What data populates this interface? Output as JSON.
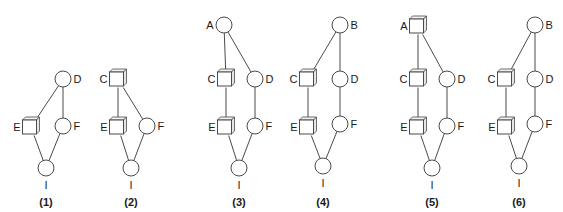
{
  "figure": {
    "colors": {
      "stroke": "#4a4a4a",
      "text": "#1a1a1a",
      "background": "#ffffff"
    },
    "diagrams": [
      {
        "caption": "(1)",
        "bottom_label": "I",
        "nodes": [
          {
            "id": "D",
            "shape": "circle",
            "x": 63,
            "y": 79,
            "label_side": "right"
          },
          {
            "id": "E",
            "shape": "cube",
            "x": 31,
            "y": 127,
            "label_side": "left"
          },
          {
            "id": "F",
            "shape": "circle",
            "x": 63,
            "y": 126,
            "label_side": "right"
          },
          {
            "id": "I",
            "shape": "circle",
            "x": 46,
            "y": 168,
            "label_side": "below"
          }
        ],
        "edges": [
          [
            "D",
            "E"
          ],
          [
            "D",
            "F"
          ],
          [
            "E",
            "I"
          ],
          [
            "F",
            "I"
          ]
        ],
        "caption_x": 46
      },
      {
        "caption": "(2)",
        "bottom_label": "I",
        "nodes": [
          {
            "id": "C",
            "shape": "cube",
            "x": 118,
            "y": 79,
            "label_side": "left"
          },
          {
            "id": "E",
            "shape": "cube",
            "x": 118,
            "y": 127,
            "label_side": "left"
          },
          {
            "id": "F",
            "shape": "circle",
            "x": 147,
            "y": 126,
            "label_side": "right"
          },
          {
            "id": "I",
            "shape": "circle",
            "x": 131,
            "y": 168,
            "label_side": "below"
          }
        ],
        "edges": [
          [
            "C",
            "E"
          ],
          [
            "C",
            "F"
          ],
          [
            "E",
            "I"
          ],
          [
            "F",
            "I"
          ]
        ],
        "caption_x": 131
      },
      {
        "caption": "(3)",
        "bottom_label": "I",
        "nodes": [
          {
            "id": "A",
            "shape": "circle",
            "x": 224,
            "y": 25,
            "label_side": "left"
          },
          {
            "id": "C",
            "shape": "cube",
            "x": 226,
            "y": 79,
            "label_side": "left"
          },
          {
            "id": "D",
            "shape": "circle",
            "x": 255,
            "y": 79,
            "label_side": "right"
          },
          {
            "id": "E",
            "shape": "cube",
            "x": 226,
            "y": 127,
            "label_side": "left"
          },
          {
            "id": "F",
            "shape": "circle",
            "x": 255,
            "y": 126,
            "label_side": "right"
          },
          {
            "id": "I",
            "shape": "circle",
            "x": 239,
            "y": 168,
            "label_side": "below"
          }
        ],
        "edges": [
          [
            "A",
            "C"
          ],
          [
            "A",
            "D"
          ],
          [
            "C",
            "E"
          ],
          [
            "D",
            "F"
          ],
          [
            "E",
            "I"
          ],
          [
            "F",
            "I"
          ]
        ],
        "caption_x": 239
      },
      {
        "caption": "(4)",
        "bottom_label": "I",
        "nodes": [
          {
            "id": "B",
            "shape": "circle",
            "x": 340,
            "y": 25,
            "label_side": "right"
          },
          {
            "id": "C",
            "shape": "cube",
            "x": 308,
            "y": 79,
            "label_side": "left"
          },
          {
            "id": "D",
            "shape": "circle",
            "x": 340,
            "y": 79,
            "label_side": "right"
          },
          {
            "id": "E",
            "shape": "cube",
            "x": 308,
            "y": 127,
            "label_side": "left"
          },
          {
            "id": "F",
            "shape": "circle",
            "x": 340,
            "y": 124,
            "label_side": "right"
          },
          {
            "id": "I",
            "shape": "circle",
            "x": 323,
            "y": 166,
            "label_side": "below"
          }
        ],
        "edges": [
          [
            "B",
            "C"
          ],
          [
            "B",
            "D"
          ],
          [
            "C",
            "E"
          ],
          [
            "D",
            "F"
          ],
          [
            "E",
            "I"
          ],
          [
            "F",
            "I"
          ]
        ],
        "caption_x": 323
      },
      {
        "caption": "(5)",
        "bottom_label": "I",
        "nodes": [
          {
            "id": "A",
            "shape": "cube",
            "x": 418,
            "y": 26,
            "label_side": "left"
          },
          {
            "id": "C",
            "shape": "cube",
            "x": 418,
            "y": 79,
            "label_side": "left"
          },
          {
            "id": "D",
            "shape": "circle",
            "x": 447,
            "y": 79,
            "label_side": "right"
          },
          {
            "id": "E",
            "shape": "cube",
            "x": 418,
            "y": 127,
            "label_side": "left"
          },
          {
            "id": "F",
            "shape": "circle",
            "x": 447,
            "y": 126,
            "label_side": "right"
          },
          {
            "id": "I",
            "shape": "circle",
            "x": 432,
            "y": 168,
            "label_side": "below"
          }
        ],
        "edges": [
          [
            "A",
            "C"
          ],
          [
            "A",
            "D"
          ],
          [
            "C",
            "E"
          ],
          [
            "D",
            "F"
          ],
          [
            "E",
            "I"
          ],
          [
            "F",
            "I"
          ]
        ],
        "caption_x": 432
      },
      {
        "caption": "(6)",
        "bottom_label": "I",
        "nodes": [
          {
            "id": "B",
            "shape": "circle",
            "x": 535,
            "y": 25,
            "label_side": "right"
          },
          {
            "id": "C",
            "shape": "cube",
            "x": 506,
            "y": 79,
            "label_side": "left"
          },
          {
            "id": "D",
            "shape": "circle",
            "x": 535,
            "y": 79,
            "label_side": "right"
          },
          {
            "id": "E",
            "shape": "cube",
            "x": 506,
            "y": 127,
            "label_side": "left"
          },
          {
            "id": "F",
            "shape": "circle",
            "x": 535,
            "y": 124,
            "label_side": "right"
          },
          {
            "id": "I",
            "shape": "circle",
            "x": 519,
            "y": 166,
            "label_side": "below"
          }
        ],
        "edges": [
          [
            "B",
            "C"
          ],
          [
            "B",
            "D"
          ],
          [
            "C",
            "E"
          ],
          [
            "D",
            "F"
          ],
          [
            "E",
            "I"
          ],
          [
            "F",
            "I"
          ]
        ],
        "caption_x": 519
      }
    ]
  }
}
